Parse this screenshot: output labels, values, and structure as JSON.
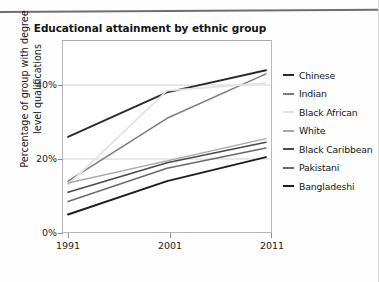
{
  "chart_data": {
    "type": "line",
    "title": "Educational attainment by ethnic group",
    "xlabel": "",
    "ylabel": "Percentage of group with degree level qualifications",
    "ylabel_line1": "Percentage of group with degree",
    "ylabel_line2": "level qualifications",
    "x": [
      "1991",
      "2001",
      "2011"
    ],
    "categories": [
      "1991",
      "2001",
      "2011"
    ],
    "xtick_labels": [
      "1991",
      "2001",
      "2011"
    ],
    "ytick_labels": [
      "0%",
      "20%",
      "40%"
    ],
    "ytick_values": [
      0,
      20,
      40
    ],
    "ylim": [
      0,
      52
    ],
    "grid": "horizontal",
    "legend_position": "right",
    "series": [
      {
        "name": "Chinese",
        "values": [
          26.0,
          38.0,
          44.0
        ],
        "color": "#2b2b2b",
        "width": 1.9
      },
      {
        "name": "Indian",
        "values": [
          14.0,
          31.0,
          43.0
        ],
        "color": "#7d7d7d",
        "width": 1.5
      },
      {
        "name": "Black African",
        "values": [
          13.0,
          38.5,
          40.5
        ],
        "color": "#e2e2e2",
        "width": 1.8
      },
      {
        "name": "White",
        "values": [
          13.5,
          19.5,
          25.5
        ],
        "color": "#a8a8a8",
        "width": 1.4
      },
      {
        "name": "Black Caribbean",
        "values": [
          11.0,
          19.0,
          24.5
        ],
        "color": "#4a4a4a",
        "width": 1.5
      },
      {
        "name": "Pakistani",
        "values": [
          8.5,
          17.5,
          23.0
        ],
        "color": "#6a6a6a",
        "width": 1.5
      },
      {
        "name": "Bangladeshi",
        "values": [
          5.0,
          14.0,
          20.5
        ],
        "color": "#1e1e1e",
        "width": 1.9
      }
    ]
  },
  "legend": {
    "items": [
      {
        "label": "Chinese"
      },
      {
        "label": "Indian"
      },
      {
        "label": "Black African"
      },
      {
        "label": "White"
      },
      {
        "label": "Black Caribbean"
      },
      {
        "label": "Pakistani"
      },
      {
        "label": "Bangladeshi"
      }
    ]
  }
}
